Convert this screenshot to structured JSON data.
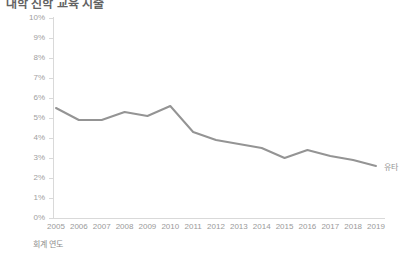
{
  "title": "대학 진학 교육 지출",
  "axes": {
    "y_title": "진학률",
    "x_title": "회계 연도"
  },
  "colors": {
    "line": "#949494",
    "axis": "#d9d9d9",
    "tick_text": "#a0a0a0",
    "title_text": "#636363",
    "label_text": "#8c8c8c"
  },
  "chart_data": {
    "type": "line",
    "title": "대학 진학 교육 지출",
    "xlabel": "회계 연도",
    "ylabel": "진학률",
    "categories": [
      "2005",
      "2006",
      "2007",
      "2008",
      "2009",
      "2010",
      "2011",
      "2012",
      "2013",
      "2014",
      "2015",
      "2016",
      "2017",
      "2018",
      "2019"
    ],
    "ytick_labels": [
      "10%",
      "9%",
      "8%",
      "7%",
      "6%",
      "5%",
      "4%",
      "3%",
      "2%",
      "1%",
      "0%"
    ],
    "ytick_values": [
      10,
      9,
      8,
      7,
      6,
      5,
      4,
      3,
      2,
      1,
      0
    ],
    "ylim": [
      0,
      10
    ],
    "y_unit": "%",
    "grid": false,
    "legend_position": "right-end-of-line",
    "series": [
      {
        "name": "유타",
        "color": "#949494",
        "values": [
          5.5,
          4.9,
          4.9,
          5.3,
          5.1,
          5.6,
          4.3,
          3.9,
          3.7,
          3.5,
          3.0,
          3.4,
          3.1,
          2.9,
          2.6
        ]
      }
    ]
  }
}
